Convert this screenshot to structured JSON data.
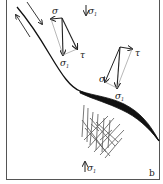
{
  "figure": {
    "panel_label": "b",
    "colors": {
      "line": "#222222",
      "construction": "#999999",
      "frame": "#555555"
    },
    "labels": {
      "sigma": "σ",
      "sigma1": "σ",
      "sigma1_sub": "1",
      "tau": "τ"
    },
    "annotations": [
      {
        "id": "top-sigma1",
        "text": "σ",
        "sub": "1",
        "note": "downward arrow, top"
      },
      {
        "id": "vector-set-1",
        "labels": [
          "σ",
          "σ1",
          "τ"
        ]
      },
      {
        "id": "vector-set-2",
        "labels": [
          "σ",
          "σ1",
          "τ"
        ]
      },
      {
        "id": "fault-sigma1",
        "text": "σ",
        "sub": "1"
      },
      {
        "id": "bottom-sigma1",
        "text": "σ",
        "sub": "1",
        "note": "upward arrow, bottom"
      }
    ],
    "elements": [
      "fault-trace",
      "shear-sense-arrows",
      "stress-vector-triangles",
      "fracture-network"
    ]
  }
}
